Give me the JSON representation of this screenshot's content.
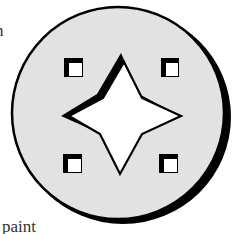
{
  "text_fragments": {
    "top_left": "n",
    "bottom_left": "paint"
  },
  "emblem": {
    "description": "circular badge with four-pointed star and four corner squares",
    "colors": {
      "disc_fill": "#e2e2e2",
      "outline": "#000000",
      "star_fill": "#ffffff",
      "square_outer": "#000000",
      "square_inner": "#ffffff",
      "background": "#ffffff"
    },
    "shapes": {
      "star": "four-pointed-star",
      "squares": [
        "top-left",
        "top-right",
        "bottom-left",
        "bottom-right"
      ]
    }
  }
}
